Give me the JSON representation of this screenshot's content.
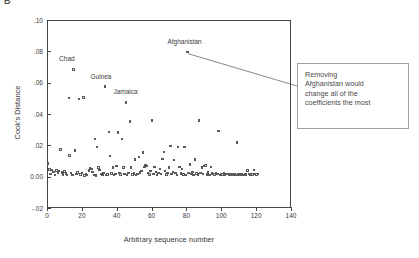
{
  "panel_label": "B",
  "annotation": {
    "text": "Removing\nAfghanistan would\nchange all of the\ncoefficients the most",
    "border_color": "#9aa0a8"
  },
  "chart_data": {
    "type": "scatter",
    "title": "",
    "xlabel": "Arbitrary sequence number",
    "ylabel": "Cook's Distance",
    "xlim": [
      0,
      140
    ],
    "ylim": [
      -0.02,
      0.1
    ],
    "grid": false,
    "legend": "none",
    "marker": "open-square",
    "marker_color": "#5a5a5a",
    "xticks": [
      "0",
      "20",
      "40",
      "60",
      "80",
      "100",
      "120",
      "140"
    ],
    "xtick_values": [
      0,
      20,
      40,
      60,
      80,
      100,
      120,
      140
    ],
    "yticks": [
      ".10",
      ".08",
      ".06",
      ".04",
      ".02",
      "0.00",
      "-.02"
    ],
    "ytick_values": [
      0.1,
      0.08,
      0.06,
      0.04,
      0.02,
      0.0,
      -0.02
    ],
    "annotations": [
      {
        "label": "Chad",
        "x": 15,
        "y": 0.0685,
        "dx": -6,
        "dy": -11
      },
      {
        "label": "Guinea",
        "x": 33,
        "y": 0.0575,
        "dx": -6,
        "dy": -11
      },
      {
        "label": "Jamaica",
        "x": 45,
        "y": 0.0475,
        "dx": -4,
        "dy": -11
      },
      {
        "label": "Afghanistan",
        "x": 80,
        "y": 0.0795,
        "dx": -11,
        "dy": -11
      }
    ],
    "leader_line": {
      "from_x": 81,
      "from_y": 0.0785,
      "to_px_x": 297,
      "to_px_y": 86
    },
    "points": [
      {
        "x": 0.5,
        "y": 0.0085
      },
      {
        "x": 1.5,
        "y": 0.0045
      },
      {
        "x": 2.0,
        "y": 0.0018
      },
      {
        "x": 3.0,
        "y": 0.0042
      },
      {
        "x": 3.8,
        "y": 0.003
      },
      {
        "x": 4.5,
        "y": 0.0012
      },
      {
        "x": 5.5,
        "y": 0.0038
      },
      {
        "x": 6.2,
        "y": 0.0022
      },
      {
        "x": 7.0,
        "y": 0.0035
      },
      {
        "x": 7.8,
        "y": 0.0172
      },
      {
        "x": 8.5,
        "y": 0.0028
      },
      {
        "x": 9.3,
        "y": 0.0015
      },
      {
        "x": 10.0,
        "y": 0.0032
      },
      {
        "x": 10.8,
        "y": 0.002
      },
      {
        "x": 11.5,
        "y": 0.001
      },
      {
        "x": 12.5,
        "y": 0.0502
      },
      {
        "x": 13.0,
        "y": 0.0135
      },
      {
        "x": 13.8,
        "y": 0.0022
      },
      {
        "x": 14.5,
        "y": 0.0012
      },
      {
        "x": 15.2,
        "y": 0.0685
      },
      {
        "x": 16.0,
        "y": 0.0168
      },
      {
        "x": 16.8,
        "y": 0.0018
      },
      {
        "x": 17.5,
        "y": 0.0028
      },
      {
        "x": 18.5,
        "y": 0.0495
      },
      {
        "x": 19.2,
        "y": 0.0014
      },
      {
        "x": 20.0,
        "y": 0.0024
      },
      {
        "x": 20.8,
        "y": 0.0505
      },
      {
        "x": 21.5,
        "y": 0.0008
      },
      {
        "x": 22.3,
        "y": 0.0018
      },
      {
        "x": 23.0,
        "y": 0.0012
      },
      {
        "x": 24.0,
        "y": 0.004
      },
      {
        "x": 24.8,
        "y": 0.0055
      },
      {
        "x": 25.5,
        "y": 0.0048
      },
      {
        "x": 26.2,
        "y": 0.003
      },
      {
        "x": 27.0,
        "y": 0.0012
      },
      {
        "x": 27.5,
        "y": 0.024
      },
      {
        "x": 28.0,
        "y": 0.0008
      },
      {
        "x": 28.8,
        "y": 0.019
      },
      {
        "x": 29.5,
        "y": 0.0058
      },
      {
        "x": 30.2,
        "y": 0.0042
      },
      {
        "x": 31.0,
        "y": 0.0018
      },
      {
        "x": 31.8,
        "y": 0.0012
      },
      {
        "x": 32.5,
        "y": 0.0022
      },
      {
        "x": 33.2,
        "y": 0.0575
      },
      {
        "x": 34.0,
        "y": 0.001
      },
      {
        "x": 34.8,
        "y": 0.0015
      },
      {
        "x": 35.5,
        "y": 0.0285
      },
      {
        "x": 36.2,
        "y": 0.0132
      },
      {
        "x": 37.0,
        "y": 0.002
      },
      {
        "x": 37.8,
        "y": 0.0058
      },
      {
        "x": 38.5,
        "y": 0.0012
      },
      {
        "x": 39.2,
        "y": 0.0018
      },
      {
        "x": 40.0,
        "y": 0.0068
      },
      {
        "x": 40.8,
        "y": 0.0282
      },
      {
        "x": 41.5,
        "y": 0.0022
      },
      {
        "x": 42.2,
        "y": 0.0014
      },
      {
        "x": 43.0,
        "y": 0.024
      },
      {
        "x": 43.8,
        "y": 0.006
      },
      {
        "x": 44.5,
        "y": 0.0018
      },
      {
        "x": 45.2,
        "y": 0.0475
      },
      {
        "x": 46.0,
        "y": 0.001
      },
      {
        "x": 46.8,
        "y": 0.0022
      },
      {
        "x": 47.5,
        "y": 0.0352
      },
      {
        "x": 48.2,
        "y": 0.0058
      },
      {
        "x": 49.0,
        "y": 0.0015
      },
      {
        "x": 49.8,
        "y": 0.002
      },
      {
        "x": 50.5,
        "y": 0.0108
      },
      {
        "x": 51.2,
        "y": 0.0012
      },
      {
        "x": 52.0,
        "y": 0.0018
      },
      {
        "x": 52.8,
        "y": 0.0125
      },
      {
        "x": 53.5,
        "y": 0.0028
      },
      {
        "x": 54.2,
        "y": 0.0035
      },
      {
        "x": 55.0,
        "y": 0.0155
      },
      {
        "x": 55.8,
        "y": 0.0062
      },
      {
        "x": 56.5,
        "y": 0.007
      },
      {
        "x": 57.2,
        "y": 0.0068
      },
      {
        "x": 58.0,
        "y": 0.0022
      },
      {
        "x": 58.8,
        "y": 0.0014
      },
      {
        "x": 59.5,
        "y": 0.0035
      },
      {
        "x": 60.2,
        "y": 0.0358
      },
      {
        "x": 61.0,
        "y": 0.0018
      },
      {
        "x": 61.8,
        "y": 0.0062
      },
      {
        "x": 62.5,
        "y": 0.003
      },
      {
        "x": 63.2,
        "y": 0.0012
      },
      {
        "x": 64.0,
        "y": 0.0022
      },
      {
        "x": 64.8,
        "y": 0.0048
      },
      {
        "x": 65.5,
        "y": 0.0018
      },
      {
        "x": 66.2,
        "y": 0.0112
      },
      {
        "x": 67.0,
        "y": 0.0158
      },
      {
        "x": 67.8,
        "y": 0.0035
      },
      {
        "x": 68.5,
        "y": 0.0014
      },
      {
        "x": 69.2,
        "y": 0.0022
      },
      {
        "x": 70.0,
        "y": 0.006
      },
      {
        "x": 70.8,
        "y": 0.0195
      },
      {
        "x": 71.5,
        "y": 0.0018
      },
      {
        "x": 72.2,
        "y": 0.003
      },
      {
        "x": 73.0,
        "y": 0.0105
      },
      {
        "x": 73.8,
        "y": 0.0024
      },
      {
        "x": 74.5,
        "y": 0.0012
      },
      {
        "x": 75.2,
        "y": 0.0188
      },
      {
        "x": 76.0,
        "y": 0.0062
      },
      {
        "x": 76.8,
        "y": 0.002
      },
      {
        "x": 77.5,
        "y": 0.0048
      },
      {
        "x": 78.2,
        "y": 0.0015
      },
      {
        "x": 79.0,
        "y": 0.0188
      },
      {
        "x": 79.8,
        "y": 0.001
      },
      {
        "x": 80.5,
        "y": 0.0795
      },
      {
        "x": 81.2,
        "y": 0.0022
      },
      {
        "x": 82.0,
        "y": 0.0078
      },
      {
        "x": 82.8,
        "y": 0.0018
      },
      {
        "x": 83.5,
        "y": 0.003
      },
      {
        "x": 84.2,
        "y": 0.0012
      },
      {
        "x": 85.0,
        "y": 0.0108
      },
      {
        "x": 85.8,
        "y": 0.002
      },
      {
        "x": 86.5,
        "y": 0.0014
      },
      {
        "x": 87.2,
        "y": 0.0358
      },
      {
        "x": 88.0,
        "y": 0.0022
      },
      {
        "x": 88.8,
        "y": 0.006
      },
      {
        "x": 89.5,
        "y": 0.0018
      },
      {
        "x": 90.2,
        "y": 0.0068
      },
      {
        "x": 91.0,
        "y": 0.0072
      },
      {
        "x": 91.8,
        "y": 0.0015
      },
      {
        "x": 92.5,
        "y": 0.0025
      },
      {
        "x": 93.2,
        "y": 0.0012
      },
      {
        "x": 94.0,
        "y": 0.0062
      },
      {
        "x": 94.8,
        "y": 0.002
      },
      {
        "x": 95.5,
        "y": 0.0018
      },
      {
        "x": 96.2,
        "y": 0.0014
      },
      {
        "x": 97.0,
        "y": 0.0022
      },
      {
        "x": 97.8,
        "y": 0.0016
      },
      {
        "x": 98.5,
        "y": 0.029
      },
      {
        "x": 99.2,
        "y": 0.0012
      },
      {
        "x": 100.0,
        "y": 0.0018
      },
      {
        "x": 100.8,
        "y": 0.0015
      },
      {
        "x": 101.5,
        "y": 0.002
      },
      {
        "x": 102.2,
        "y": 0.0014
      },
      {
        "x": 103.0,
        "y": 0.0016
      },
      {
        "x": 103.8,
        "y": 0.0018
      },
      {
        "x": 104.5,
        "y": 0.0012
      },
      {
        "x": 105.2,
        "y": 0.0015
      },
      {
        "x": 106.0,
        "y": 0.0018
      },
      {
        "x": 106.8,
        "y": 0.0014
      },
      {
        "x": 107.5,
        "y": 0.0016
      },
      {
        "x": 108.2,
        "y": 0.0012
      },
      {
        "x": 109.0,
        "y": 0.0218
      },
      {
        "x": 109.8,
        "y": 0.0015
      },
      {
        "x": 110.5,
        "y": 0.0018
      },
      {
        "x": 111.2,
        "y": 0.0014
      },
      {
        "x": 112.0,
        "y": 0.0016
      },
      {
        "x": 112.8,
        "y": 0.0012
      },
      {
        "x": 113.5,
        "y": 0.0018
      },
      {
        "x": 114.2,
        "y": 0.0015
      },
      {
        "x": 115.0,
        "y": 0.004
      },
      {
        "x": 115.8,
        "y": 0.0016
      },
      {
        "x": 116.5,
        "y": 0.0014
      },
      {
        "x": 117.2,
        "y": 0.0018
      },
      {
        "x": 118.0,
        "y": 0.0015
      },
      {
        "x": 118.8,
        "y": 0.0042
      },
      {
        "x": 119.5,
        "y": 0.0016
      },
      {
        "x": 120.2,
        "y": 0.0014
      },
      {
        "x": 121.0,
        "y": 0.0018
      }
    ]
  }
}
